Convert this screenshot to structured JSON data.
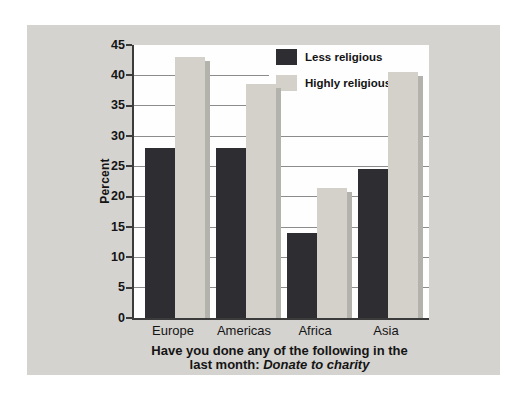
{
  "figure": {
    "panel_bg": "#d4d3d0",
    "plot_bg": "#fefefe",
    "gridline_color": "#8c8c8c",
    "axis_color": "#3b3b3b",
    "text_color": "#141414"
  },
  "chart_data": {
    "type": "bar",
    "title": "",
    "categories": [
      "Europe",
      "Americas",
      "Africa",
      "Asia"
    ],
    "series": [
      {
        "name": "Less religious",
        "color": "#2e2d31",
        "values": [
          28,
          28,
          14,
          24.5
        ]
      },
      {
        "name": "Highly religious",
        "color": "#d3d1ca",
        "shadow_color": "#b3b2ad",
        "values": [
          43,
          38.5,
          21.5,
          40.5
        ]
      }
    ],
    "xlabel": "",
    "ylabel": "Percent",
    "ylim": [
      0,
      45
    ],
    "yticks": [
      0,
      5,
      10,
      15,
      20,
      25,
      30,
      35,
      40,
      45
    ],
    "grid": "horizontal-only",
    "legend_position": "top-right-inside",
    "caption_line1": "Have you done any of the following in the",
    "caption_line2_prefix": "last month: ",
    "caption_line2_italic": "Donate to charity"
  }
}
